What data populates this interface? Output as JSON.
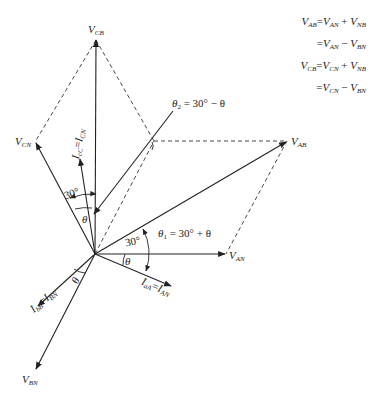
{
  "equations": [
    {
      "lhs": "V",
      "lhs_sub": "AB",
      "op1": "=",
      "t1": "V",
      "t1_sub": "AN",
      "op2": "+",
      "t2": "V",
      "t2_sub": "NB"
    },
    {
      "lhs": "",
      "lhs_sub": "",
      "op1": "=",
      "t1": "V",
      "t1_sub": "AN",
      "op2": "−",
      "t2": "V",
      "t2_sub": "BN"
    },
    {
      "lhs": "V",
      "lhs_sub": "CB",
      "op1": "=",
      "t1": "V",
      "t1_sub": "CN",
      "op2": "+",
      "t2": "V",
      "t2_sub": "NB"
    },
    {
      "lhs": "",
      "lhs_sub": "",
      "op1": "=",
      "t1": "V",
      "t1_sub": "CN",
      "op2": "−",
      "t2": "V",
      "t2_sub": "BN"
    }
  ],
  "phasors": {
    "V_CB": {
      "main": "V",
      "sub": "CB"
    },
    "V_CN": {
      "main": "V",
      "sub": "CN"
    },
    "V_AB": {
      "main": "V",
      "sub": "AB"
    },
    "V_AN": {
      "main": "V",
      "sub": "AN"
    },
    "V_BN": {
      "main": "V",
      "sub": "BN"
    },
    "I_aA": {
      "a": "I",
      "a_sub": "aA",
      "eq": "=",
      "b": "I",
      "b_sub": "AN"
    },
    "I_bB": {
      "a": "I",
      "a_sub": "bB",
      "eq": "=",
      "b": "I",
      "b_sub": "BN"
    },
    "I_cC": {
      "a": "I",
      "a_sub": "cC",
      "eq": "=",
      "b": "I",
      "b_sub": "CN"
    }
  },
  "angles": {
    "theta2": {
      "sym": "θ",
      "sub": "2",
      "expr": "= 30° − θ"
    },
    "theta1": {
      "sym": "θ",
      "sub": "1",
      "expr": "= 30° + θ"
    },
    "thirty_right": "30°",
    "thirty_left": "30°",
    "theta_right": "θ",
    "theta_left": "θ",
    "theta_bottom": "θ"
  }
}
